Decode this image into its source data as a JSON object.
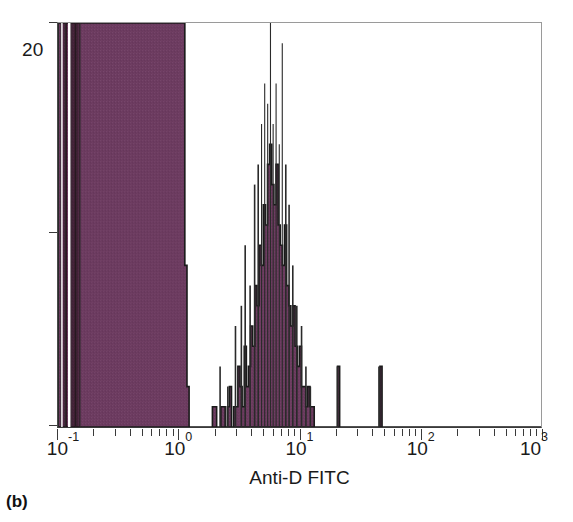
{
  "figure": {
    "panel_label": "(b)",
    "background_color": "#ffffff"
  },
  "colors": {
    "fill": "#6b3a5f",
    "outline": "#1a1a1a",
    "axis": "#3a3a3a",
    "frame_light": "#9a9a9a"
  },
  "y_axis": {
    "tick_label": "20",
    "tick_labels": [
      "20"
    ],
    "tick_positions_fraction": [
      0.0,
      0.52,
      1.0
    ]
  },
  "x_axis": {
    "title": "Anti-D FITC",
    "scale": "log10",
    "decade_labels": [
      {
        "mantissa": "10",
        "exponent": "-1",
        "value": 0.1
      },
      {
        "mantissa": "10",
        "exponent": "0",
        "value": 1
      },
      {
        "mantissa": "10",
        "exponent": "1",
        "value": 10
      },
      {
        "mantissa": "10",
        "exponent": "2",
        "value": 100
      },
      {
        "mantissa": "10",
        "exponent": "3",
        "value": 1000
      }
    ],
    "minor_tick_multipliers": [
      2,
      3,
      4,
      5,
      6,
      7,
      8,
      9
    ]
  },
  "chart_data": {
    "type": "area",
    "title": "",
    "subtitle": "",
    "xlabel": "Anti-D FITC",
    "ylabel": "",
    "xscale": "log",
    "xlim": [
      0.1,
      1000
    ],
    "ylim": [
      0,
      20
    ],
    "y_tick_max_label": "20",
    "grid": false,
    "legend": null,
    "annotations": [
      "(b)"
    ],
    "populations": [
      {
        "name": "negative-population",
        "x_range": [
          0.1,
          1.2
        ],
        "peak_count": 20,
        "clipped_at_axis_top": true
      },
      {
        "name": "positive-population",
        "x_range": [
          1.9,
          13.0
        ],
        "peak_x": 5.6,
        "peak_count": 14,
        "clipped_at_axis_top": false
      }
    ],
    "series": [
      {
        "name": "Anti-D FITC events",
        "x": [
          0.1,
          0.104,
          0.108,
          0.112,
          0.117,
          0.122,
          0.127,
          0.132,
          0.137,
          0.143,
          0.149,
          0.155,
          0.161,
          0.168,
          0.175,
          0.182,
          0.19,
          0.197,
          0.206,
          0.214,
          0.223,
          0.232,
          0.242,
          0.252,
          0.262,
          0.273,
          0.284,
          0.296,
          0.308,
          0.321,
          0.334,
          0.348,
          0.362,
          0.377,
          0.393,
          0.409,
          0.426,
          0.443,
          0.462,
          0.481,
          0.5,
          0.521,
          0.542,
          0.565,
          0.588,
          0.612,
          0.638,
          0.664,
          0.691,
          0.72,
          0.75,
          0.781,
          0.813,
          0.846,
          0.881,
          0.918,
          0.956,
          0.995,
          1.036,
          1.079,
          1.123,
          1.17,
          1.218,
          1.268,
          1.32,
          1.375,
          1.432,
          1.491,
          1.552,
          1.616,
          1.683,
          1.753,
          1.825,
          1.9,
          1.979,
          2.06,
          2.146,
          2.234,
          2.327,
          2.423,
          2.523,
          2.627,
          2.735,
          2.848,
          2.966,
          3.088,
          3.215,
          3.348,
          3.486,
          3.63,
          3.779,
          3.935,
          4.097,
          4.266,
          4.442,
          4.625,
          4.816,
          5.015,
          5.222,
          5.437,
          5.661,
          5.894,
          6.138,
          6.391,
          6.654,
          6.928,
          7.214,
          7.511,
          7.821,
          8.144,
          8.48,
          8.83,
          9.194,
          9.573,
          9.968,
          10.38,
          10.81,
          11.26,
          11.72,
          12.21,
          12.71,
          13.24,
          13.78,
          14.35,
          14.94,
          15.56,
          16.2,
          16.87,
          17.57,
          18.29,
          19.05,
          19.83,
          20.65,
          21.5,
          22.39,
          23.31,
          24.27,
          25.27,
          26.32,
          27.41,
          28.54,
          29.71,
          30.94,
          32.22,
          33.55,
          34.93,
          36.37,
          37.87,
          39.43,
          41.06,
          42.76,
          44.52,
          46.36,
          48.27,
          50.26,
          52.33,
          54.49,
          56.74,
          59.08,
          61.52,
          64.06,
          66.7,
          69.45,
          72.32,
          75.31,
          78.42,
          81.65,
          85.02,
          88.53,
          92.18,
          95.99,
          99.95,
          104.1,
          108.4,
          112.8,
          117.5,
          122.3,
          127.4,
          132.6,
          138.1,
          143.8,
          149.7,
          155.9,
          162.3,
          169.0,
          176.0,
          183.3,
          190.8,
          198.7,
          206.9,
          215.4,
          224.3,
          233.6,
          243.2,
          253.3,
          263.7,
          274.6,
          286.0,
          297.8,
          310.1,
          322.9,
          336.2,
          350.1,
          364.6,
          379.6,
          395.3,
          411.6,
          428.6,
          446.4,
          464.8,
          484.0,
          504.0,
          524.8,
          546.5,
          569.0,
          592.5,
          617.0,
          642.5,
          669.0,
          696.6,
          725.4,
          755.4,
          786.6,
          819.1,
          853.0,
          888.2,
          924.9,
          963.2,
          1000.0
        ],
        "values": [
          20,
          20,
          20,
          20,
          20,
          20,
          20,
          20,
          20,
          20,
          20,
          20,
          20,
          20,
          20,
          20,
          20,
          20,
          20,
          20,
          20,
          20,
          20,
          20,
          20,
          20,
          20,
          20,
          20,
          20,
          20,
          20,
          20,
          20,
          20,
          20,
          20,
          20,
          20,
          20,
          20,
          20,
          20,
          20,
          20,
          20,
          20,
          20,
          20,
          20,
          20,
          20,
          20,
          20,
          20,
          20,
          20,
          20,
          20,
          20,
          8,
          2,
          0,
          0,
          0,
          0,
          0,
          0,
          0,
          0,
          0,
          0,
          0,
          1,
          1,
          0,
          0,
          1,
          1,
          0,
          1,
          2,
          0,
          1,
          1,
          3,
          2,
          1,
          4,
          2,
          3,
          5,
          4,
          7,
          6,
          9,
          8,
          11,
          10,
          13,
          14,
          12,
          11,
          13,
          10,
          9,
          8,
          10,
          7,
          6,
          5,
          6,
          4,
          3,
          4,
          2,
          2,
          1,
          2,
          1,
          1,
          0,
          0,
          0,
          0,
          0,
          0,
          0,
          0,
          0,
          0,
          0,
          3,
          0,
          0,
          0,
          0,
          0,
          0,
          0,
          0,
          0,
          0,
          0,
          0,
          0,
          0,
          0,
          0,
          0,
          0,
          0,
          3,
          0,
          0,
          0,
          0,
          0,
          0,
          0,
          0,
          0,
          0,
          0,
          0,
          0,
          0,
          0,
          0,
          0,
          0,
          0,
          0,
          0,
          0,
          0,
          0,
          0,
          0,
          0,
          0,
          0,
          0,
          0,
          0,
          0,
          0,
          0,
          0,
          0,
          0,
          0,
          0,
          0,
          0,
          0,
          0,
          0,
          0,
          0,
          0,
          0,
          0,
          0,
          0,
          0,
          0,
          0,
          0,
          0,
          0,
          0,
          0,
          0,
          0,
          0,
          0,
          0,
          0,
          0,
          0,
          0,
          0,
          0,
          0,
          0,
          0,
          0,
          0
        ]
      }
    ],
    "spikes": [
      {
        "x": 0.101,
        "value": 20
      },
      {
        "x": 0.106,
        "value": 20
      },
      {
        "x": 0.115,
        "value": 20
      },
      {
        "x": 0.128,
        "value": 20
      },
      {
        "x": 0.14,
        "value": 20
      },
      {
        "x": 0.152,
        "value": 20
      },
      {
        "x": 2.2,
        "value": 3
      },
      {
        "x": 2.55,
        "value": 2
      },
      {
        "x": 2.95,
        "value": 5
      },
      {
        "x": 3.3,
        "value": 6
      },
      {
        "x": 3.55,
        "value": 9
      },
      {
        "x": 3.9,
        "value": 7
      },
      {
        "x": 4.25,
        "value": 12
      },
      {
        "x": 4.55,
        "value": 13
      },
      {
        "x": 4.85,
        "value": 15
      },
      {
        "x": 5.15,
        "value": 17
      },
      {
        "x": 5.45,
        "value": 16
      },
      {
        "x": 5.75,
        "value": 20
      },
      {
        "x": 6.05,
        "value": 15
      },
      {
        "x": 6.4,
        "value": 17
      },
      {
        "x": 6.8,
        "value": 14
      },
      {
        "x": 7.2,
        "value": 19
      },
      {
        "x": 7.7,
        "value": 13
      },
      {
        "x": 8.2,
        "value": 11
      },
      {
        "x": 8.8,
        "value": 8
      },
      {
        "x": 9.5,
        "value": 6
      },
      {
        "x": 10.4,
        "value": 5
      },
      {
        "x": 11.3,
        "value": 3
      },
      {
        "x": 12.3,
        "value": 2
      },
      {
        "x": 20.6,
        "value": 3
      },
      {
        "x": 45.5,
        "value": 3
      }
    ]
  }
}
